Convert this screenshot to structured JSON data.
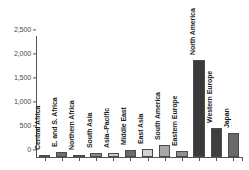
{
  "chart_data": {
    "type": "bar",
    "title": "",
    "subtitle": "",
    "xlabel": "",
    "ylabel": "",
    "ylim": [
      0,
      2500
    ],
    "grid": false,
    "legend": null,
    "y_ticks": [
      {
        "value": 2500,
        "label": "2,500"
      },
      {
        "value": 2000,
        "label": "2,000"
      },
      {
        "value": 1500,
        "label": "1,500"
      },
      {
        "value": 1000,
        "label": "1,000"
      },
      {
        "value": 500,
        "label": "500"
      },
      {
        "value": 0,
        "label": "0"
      }
    ],
    "categories": [
      "Central Africa",
      "E. and S. Africa",
      "Northern Africa",
      "South Asia",
      "Asia–Pacific",
      "Middle East",
      "East Asia",
      "South America",
      "Eastern Europe",
      "North America",
      "Western Europe",
      "Japan"
    ],
    "values": [
      40,
      95,
      50,
      75,
      80,
      140,
      165,
      250,
      120,
      2020,
      605,
      495
    ],
    "bar_colors": [
      "#8c8c8c",
      "#6e6e6e",
      "#9a9a9a",
      "#8a8a8a",
      "#c9c9c9",
      "#6b6b6b",
      "#d2d2d2",
      "#a8a8a8",
      "#8f8f8f",
      "#3a3a3a",
      "#3f3f3f",
      "#6a6a6a"
    ],
    "axis_color": "#555555",
    "tick_label_color": "#4a4a4a",
    "bar_label_color": "#1c1c1c"
  }
}
